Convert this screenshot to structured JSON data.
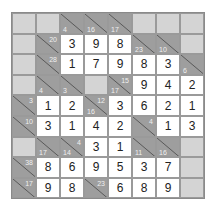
{
  "puzzle": {
    "type": "kakuro",
    "rows": 9,
    "cols": 8,
    "colors": {
      "blank": "#d4d4d4",
      "clue": "#9e9e9e",
      "value": "#ffffff",
      "text": "#222222"
    },
    "grid": [
      [
        {
          "t": "b"
        },
        {
          "t": "b"
        },
        {
          "t": "c",
          "d": "4"
        },
        {
          "t": "c",
          "d": "16"
        },
        {
          "t": "c",
          "d": "17"
        },
        {
          "t": "b"
        },
        {
          "t": "b"
        },
        {
          "t": "b"
        }
      ],
      [
        {
          "t": "b"
        },
        {
          "t": "c",
          "r": "20"
        },
        {
          "t": "v",
          "v": "3"
        },
        {
          "t": "v",
          "v": "9"
        },
        {
          "t": "v",
          "v": "8"
        },
        {
          "t": "c",
          "d": "23"
        },
        {
          "t": "c",
          "d": "10"
        },
        {
          "t": "b"
        }
      ],
      [
        {
          "t": "b"
        },
        {
          "t": "c",
          "r": "28"
        },
        {
          "t": "v",
          "v": "1"
        },
        {
          "t": "v",
          "v": "7"
        },
        {
          "t": "v",
          "v": "9"
        },
        {
          "t": "v",
          "v": "8"
        },
        {
          "t": "v",
          "v": "3"
        },
        {
          "t": "c",
          "d": "6"
        }
      ],
      [
        {
          "t": "b"
        },
        {
          "t": "c",
          "d": "4"
        },
        {
          "t": "c",
          "d": "3"
        },
        {
          "t": "b"
        },
        {
          "t": "c",
          "d": "17",
          "r": "15"
        },
        {
          "t": "v",
          "v": "9"
        },
        {
          "t": "v",
          "v": "4"
        },
        {
          "t": "v",
          "v": "2"
        }
      ],
      [
        {
          "t": "c",
          "r": "3"
        },
        {
          "t": "v",
          "v": "1"
        },
        {
          "t": "v",
          "v": "2"
        },
        {
          "t": "c",
          "d": "16",
          "r": "12"
        },
        {
          "t": "v",
          "v": "3"
        },
        {
          "t": "v",
          "v": "6"
        },
        {
          "t": "v",
          "v": "2"
        },
        {
          "t": "v",
          "v": "1"
        }
      ],
      [
        {
          "t": "c",
          "r": "10"
        },
        {
          "t": "v",
          "v": "3"
        },
        {
          "t": "v",
          "v": "1"
        },
        {
          "t": "v",
          "v": "4"
        },
        {
          "t": "v",
          "v": "2"
        },
        {
          "t": "c",
          "r": "4"
        },
        {
          "t": "v",
          "v": "1"
        },
        {
          "t": "v",
          "v": "3"
        }
      ],
      [
        {
          "t": "b"
        },
        {
          "t": "c",
          "d": "17"
        },
        {
          "t": "c",
          "d": "14",
          "r": "4"
        },
        {
          "t": "v",
          "v": "3"
        },
        {
          "t": "v",
          "v": "1"
        },
        {
          "t": "c",
          "d": "11"
        },
        {
          "t": "c",
          "d": "16"
        },
        {
          "t": "b"
        }
      ],
      [
        {
          "t": "c",
          "r": "38"
        },
        {
          "t": "v",
          "v": "8"
        },
        {
          "t": "v",
          "v": "6"
        },
        {
          "t": "v",
          "v": "9"
        },
        {
          "t": "v",
          "v": "5"
        },
        {
          "t": "v",
          "v": "3"
        },
        {
          "t": "v",
          "v": "7"
        },
        {
          "t": "b"
        }
      ],
      [
        {
          "t": "c",
          "r": "17"
        },
        {
          "t": "v",
          "v": "9"
        },
        {
          "t": "v",
          "v": "8"
        },
        {
          "t": "c",
          "r": "23"
        },
        {
          "t": "v",
          "v": "6"
        },
        {
          "t": "v",
          "v": "8"
        },
        {
          "t": "v",
          "v": "9"
        },
        {
          "t": "b"
        }
      ]
    ]
  }
}
